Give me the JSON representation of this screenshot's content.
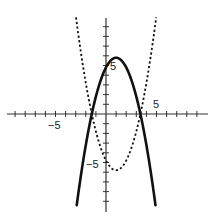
{
  "chart_data": {
    "type": "line",
    "title": "",
    "xlabel": "",
    "ylabel": "",
    "xlim": [
      -10,
      10
    ],
    "ylim": [
      -10,
      10
    ],
    "grid": false,
    "legend": null,
    "tick_step": 1,
    "tick_labels": {
      "x": [
        {
          "value": -5,
          "label": "−5"
        },
        {
          "value": 5,
          "label": "5"
        }
      ],
      "y": [
        {
          "value": 5,
          "label": "5"
        },
        {
          "value": -5,
          "label": "−5"
        }
      ]
    },
    "series": [
      {
        "name": "solid parabola",
        "style": "solid",
        "equation": "y = -(x - 1)^2 + 5.8",
        "vertex": [
          1,
          5.8
        ],
        "roots": [
          -1.4,
          3.4
        ],
        "y_intercept": 4.8,
        "x": [
          -2.9,
          -2,
          -1,
          0,
          1,
          2,
          3,
          4,
          4.9
        ],
        "y": [
          -9.4,
          -3.2,
          1.8,
          4.8,
          5.8,
          4.8,
          1.8,
          -3.2,
          -9.4
        ]
      },
      {
        "name": "dashed parabola",
        "style": "dashed",
        "equation": "y = (x - 1)^2 - 5.8",
        "vertex": [
          1,
          -5.8
        ],
        "roots": [
          -1.4,
          3.4
        ],
        "y_intercept": -4.8,
        "x": [
          -3,
          -2,
          -1,
          0,
          1,
          2,
          3,
          4,
          5
        ],
        "y": [
          10.2,
          3.2,
          -1.8,
          -4.8,
          -5.8,
          -4.8,
          -1.8,
          3.2,
          10.2
        ]
      }
    ]
  },
  "axes": {
    "x_label_neg": "−5",
    "x_label_pos": "5",
    "y_label_pos": "5",
    "y_label_neg": "−5"
  },
  "colors": {
    "axis": "#333333",
    "curve": "#111111"
  }
}
